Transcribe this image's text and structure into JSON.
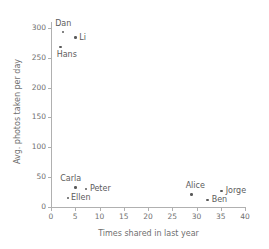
{
  "chart_data": {
    "type": "scatter",
    "title": "",
    "xlabel": "Times shared in last year",
    "ylabel": "Avg. photos taken per day",
    "xlim": [
      0,
      40
    ],
    "ylim": [
      0,
      310
    ],
    "grid": false,
    "legend": null,
    "xticks": [
      0,
      5,
      10,
      15,
      20,
      25,
      30,
      35,
      40
    ],
    "xtick_labels": [
      "0",
      "5",
      "10",
      "15",
      "20",
      "25",
      "30",
      "35",
      "40"
    ],
    "yticks": [
      0,
      50,
      100,
      150,
      200,
      250,
      300
    ],
    "ytick_labels": [
      "0",
      "50",
      "100",
      "150",
      "200",
      "250",
      "300"
    ],
    "points": [
      {
        "name": "Dan",
        "x": 2.5,
        "y": 293,
        "label_dx": -8,
        "label_dy": -13
      },
      {
        "name": "Li",
        "x": 5.0,
        "y": 284,
        "label_dx": 4,
        "label_dy": -5
      },
      {
        "name": "Hans",
        "x": 2.0,
        "y": 268,
        "label_dx": -4,
        "label_dy": 3
      },
      {
        "name": "Carla",
        "x": 5.0,
        "y": 33,
        "label_dx": -15,
        "label_dy": -13
      },
      {
        "name": "Peter",
        "x": 7.2,
        "y": 30,
        "label_dx": 4,
        "label_dy": -5
      },
      {
        "name": "Ellen",
        "x": 3.5,
        "y": 15,
        "label_dx": 3,
        "label_dy": -5
      },
      {
        "name": "Alice",
        "x": 29.0,
        "y": 21,
        "label_dx": -6,
        "label_dy": -13
      },
      {
        "name": "Jorge",
        "x": 35.2,
        "y": 27,
        "label_dx": 4,
        "label_dy": -5
      },
      {
        "name": "Ben",
        "x": 32.3,
        "y": 12,
        "label_dx": 4,
        "label_dy": -5
      }
    ]
  },
  "colors": {
    "marker": "#5a5a5a",
    "axis": "#b0b0b0",
    "text": "#6f6f6f",
    "background": "#ffffff"
  }
}
